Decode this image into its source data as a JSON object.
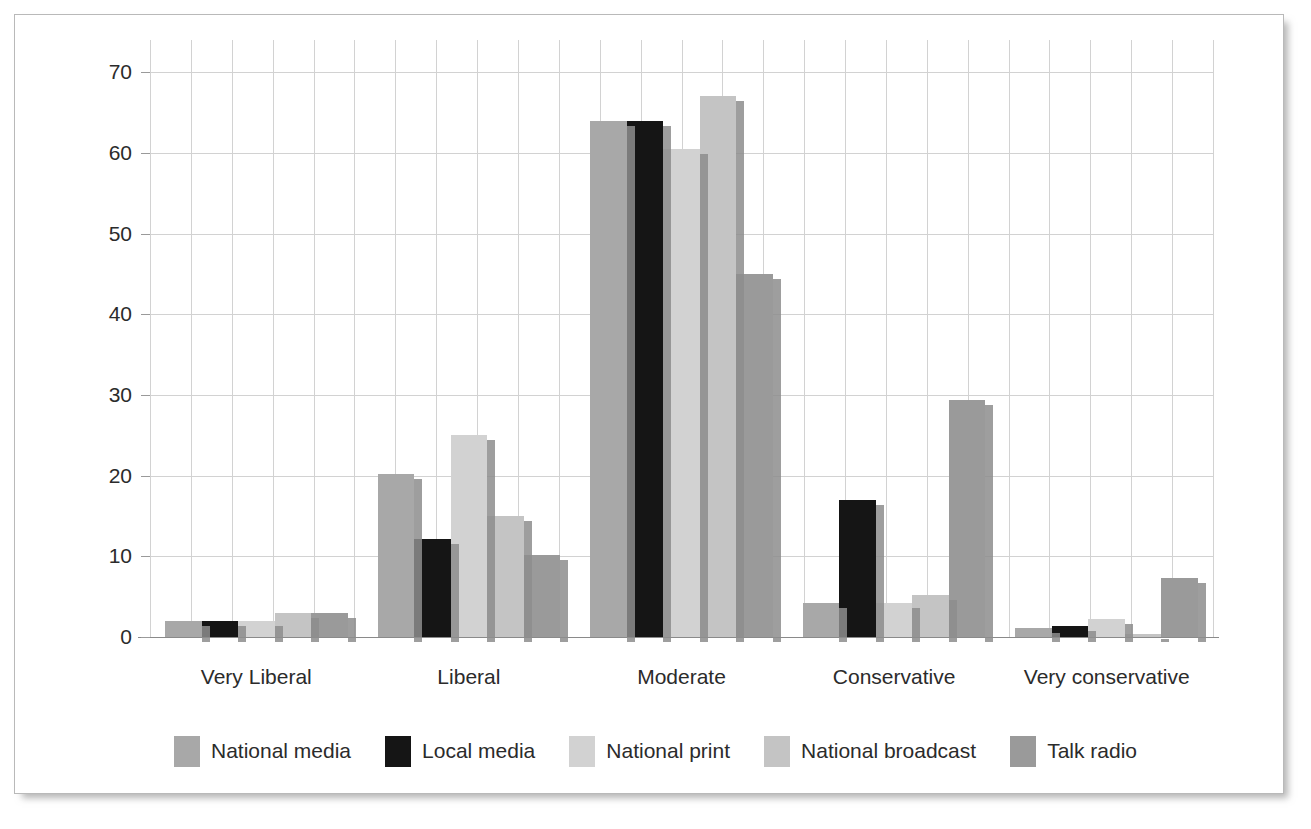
{
  "chart_data": {
    "type": "bar",
    "title": "",
    "xlabel": "",
    "ylabel": "Percentage",
    "ylim": [
      0,
      74
    ],
    "yticks": [
      0,
      10,
      20,
      30,
      40,
      50,
      60,
      70
    ],
    "grid": true,
    "legend_position": "bottom",
    "categories": [
      "Very Liberal",
      "Liberal",
      "Moderate",
      "Conservative",
      "Very conservative"
    ],
    "series": [
      {
        "name": "National media",
        "color": "#a8a8a8",
        "values": [
          2,
          20.2,
          64,
          4.2,
          1.1
        ]
      },
      {
        "name": "Local media",
        "color": "#151515",
        "values": [
          2,
          12.2,
          64,
          17,
          1.4
        ]
      },
      {
        "name": "National print",
        "color": "#d2d2d2",
        "values": [
          2,
          25,
          60.5,
          4.2,
          2.2
        ]
      },
      {
        "name": "National broadcast",
        "color": "#c4c4c4",
        "values": [
          3,
          15,
          67,
          5.2,
          0.4
        ]
      },
      {
        "name": "Talk radio",
        "color": "#9a9a9a",
        "values": [
          3,
          10.2,
          45,
          29.4,
          7.3
        ]
      }
    ]
  },
  "axis": {
    "y_tick_labels": [
      "0",
      "10",
      "20",
      "30",
      "40",
      "50",
      "60",
      "70"
    ],
    "y_axis_title": "Percentage",
    "x_tick_labels": [
      "Very Liberal",
      "Liberal",
      "Moderate",
      "Conservative",
      "Very conservative"
    ]
  },
  "legend": {
    "items": [
      {
        "label": "National media",
        "color": "#a8a8a8"
      },
      {
        "label": "Local media",
        "color": "#151515"
      },
      {
        "label": "National print",
        "color": "#d2d2d2"
      },
      {
        "label": "National broadcast",
        "color": "#c4c4c4"
      },
      {
        "label": "Talk radio",
        "color": "#9a9a9a"
      }
    ]
  }
}
